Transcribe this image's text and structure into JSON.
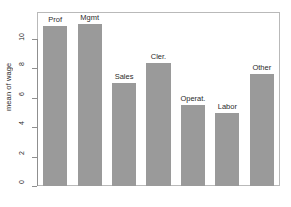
{
  "chart_data": {
    "type": "bar",
    "title": "",
    "xlabel": "",
    "ylabel": "mean of wage",
    "categories": [
      "Prof",
      "Mgmt",
      "Sales",
      "Cler.",
      "Operat.",
      "Labor",
      "Other"
    ],
    "values": [
      10.9,
      11.0,
      7.0,
      8.35,
      5.5,
      4.95,
      7.6
    ],
    "ylim": [
      0,
      11.3
    ],
    "yticks": [
      0,
      2,
      4,
      6,
      8,
      10
    ],
    "ytick_labels": [
      "0",
      "2",
      "4",
      "6",
      "8",
      "10"
    ],
    "grid": false,
    "legend": null,
    "bar_color": "#9a9a9a",
    "axis_color": "#8f8f8f",
    "frame_color": "#b9b9b9",
    "text_color": "#2b2b2b"
  }
}
